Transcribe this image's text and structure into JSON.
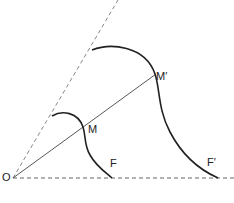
{
  "diagram": {
    "labels": {
      "origin": "O",
      "point_m": "M",
      "point_m_prime": "M′",
      "point_f": "F",
      "point_f_prime": "F′"
    },
    "colors": {
      "stroke": "#222222",
      "dashed": "#888888",
      "background": "#ffffff"
    }
  }
}
